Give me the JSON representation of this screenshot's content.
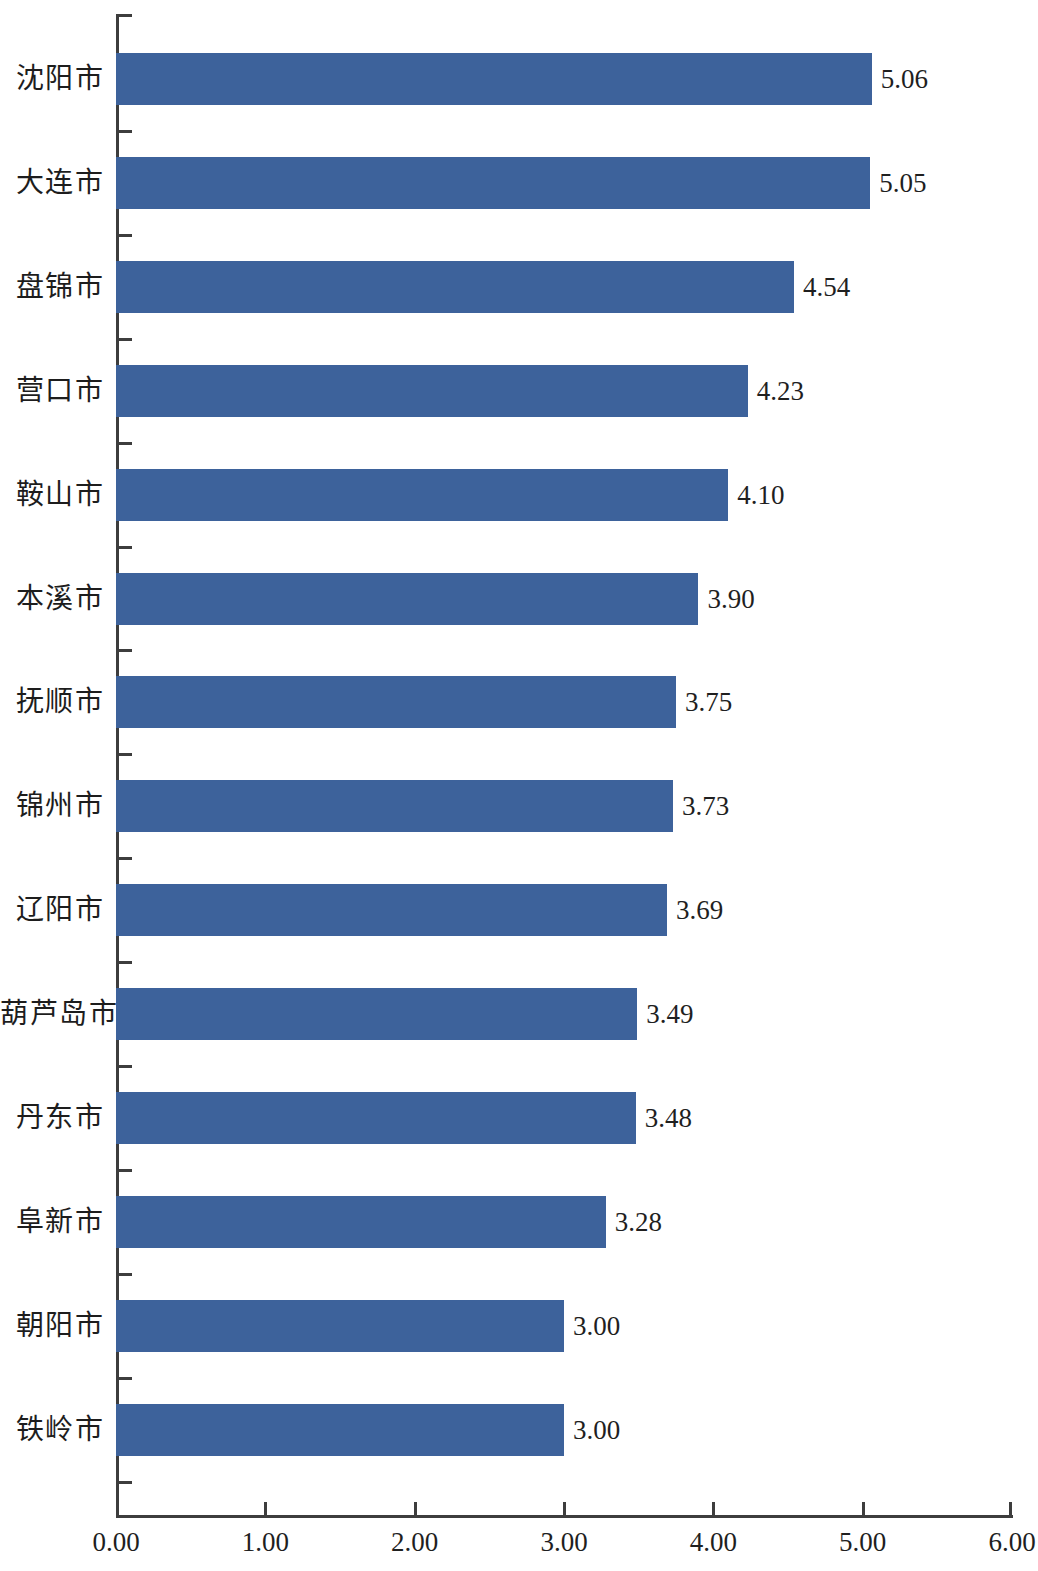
{
  "chart_data": {
    "type": "bar",
    "orientation": "horizontal",
    "title": "",
    "subtitle": "",
    "xlabel": "",
    "ylabel": "",
    "xlim": [
      0.0,
      6.0
    ],
    "xticks": [
      "0.00",
      "1.00",
      "2.00",
      "3.00",
      "4.00",
      "5.00",
      "6.00"
    ],
    "xtick_values": [
      0,
      1,
      2,
      3,
      4,
      5,
      6
    ],
    "grid": false,
    "legend": null,
    "bar_color": "#3d629b",
    "axis_color": "#3d3d3d",
    "text_color": "#1d1d1d",
    "categories": [
      "沈阳市",
      "大连市",
      "盘锦市",
      "营口市",
      "鞍山市",
      "本溪市",
      "抚顺市",
      "锦州市",
      "辽阳市",
      "葫芦岛市",
      "丹东市",
      "阜新市",
      "朝阳市",
      "铁岭市"
    ],
    "values": [
      5.06,
      5.05,
      4.54,
      4.23,
      4.1,
      3.9,
      3.75,
      3.73,
      3.69,
      3.49,
      3.48,
      3.28,
      3.0,
      3.0
    ],
    "value_labels": [
      "5.06",
      "5.05",
      "4.54",
      "4.23",
      "4.10",
      "3.90",
      "3.75",
      "3.73",
      "3.69",
      "3.49",
      "3.48",
      "3.28",
      "3.00",
      "3.00"
    ]
  }
}
